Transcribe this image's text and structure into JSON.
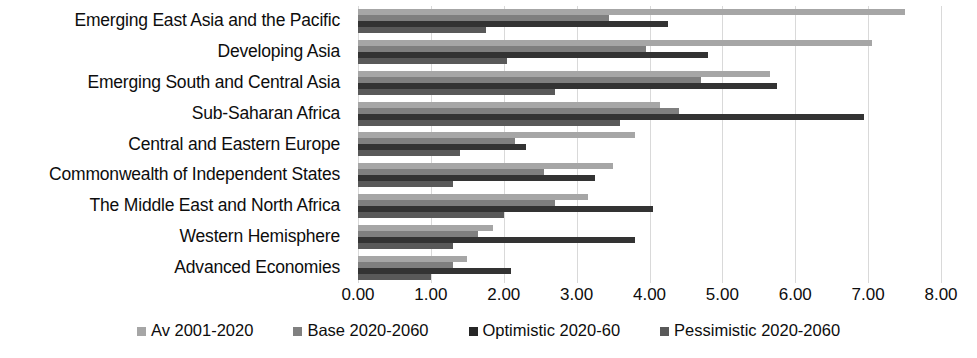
{
  "chart_data": {
    "type": "bar",
    "orientation": "horizontal",
    "title": "",
    "xlabel": "",
    "ylabel": "",
    "xlim": [
      0.0,
      8.0
    ],
    "xticks": [
      "0.00",
      "1.00",
      "2.00",
      "3.00",
      "4.00",
      "5.00",
      "6.00",
      "7.00",
      "8.00"
    ],
    "grid": true,
    "legend_position": "bottom",
    "categories": [
      "Emerging East Asia and the Pacific",
      "Developing Asia",
      "Emerging South and Central Asia",
      "Sub-Saharan Africa",
      "Central and Eastern Europe",
      "Commonwealth of Independent States",
      "The Middle East and North Africa",
      "Western Hemisphere",
      "Advanced Economies"
    ],
    "series": [
      {
        "name": "Av 2001-2020",
        "color": "#a6a6a6",
        "values": [
          7.5,
          7.05,
          5.65,
          4.15,
          3.8,
          3.5,
          3.15,
          1.85,
          1.5
        ]
      },
      {
        "name": "Base 2020-2060",
        "color": "#7f7f7f",
        "values": [
          3.45,
          3.95,
          4.7,
          4.4,
          2.15,
          2.55,
          2.7,
          1.65,
          1.3
        ]
      },
      {
        "name": "Optimistic 2020-60",
        "color": "#333333",
        "values": [
          4.25,
          4.8,
          5.75,
          6.95,
          2.3,
          3.25,
          4.05,
          3.8,
          2.1
        ]
      },
      {
        "name": "Pessimistic 2020-2060",
        "color": "#595959",
        "values": [
          1.75,
          2.05,
          2.7,
          3.6,
          1.4,
          1.3,
          2.0,
          1.3,
          1.0
        ]
      }
    ]
  },
  "legend": {
    "items": [
      {
        "label": "Av 2001-2020"
      },
      {
        "label": "Base 2020-2060"
      },
      {
        "label": "Optimistic 2020-60"
      },
      {
        "label": "Pessimistic 2020-2060"
      }
    ]
  }
}
